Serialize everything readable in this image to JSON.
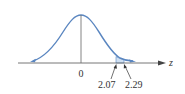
{
  "diagram": {
    "type": "normal-distribution-curve",
    "axis_label": "z",
    "center_label": "0",
    "shaded_region": {
      "from": "2.07",
      "to": "2.29"
    },
    "colors": {
      "curve": "#5a86c0",
      "shade": "#cfe0f3",
      "axis": "#555555",
      "text": "#333333"
    }
  }
}
